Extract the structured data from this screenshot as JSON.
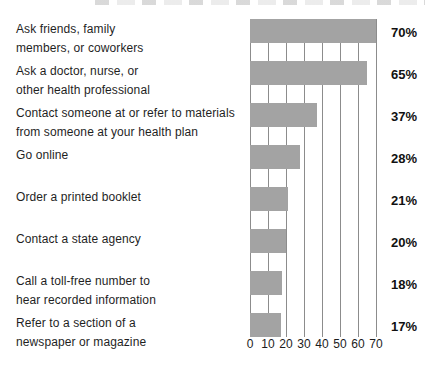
{
  "chart_data": {
    "type": "bar",
    "orientation": "horizontal",
    "title": "",
    "xlabel": "",
    "ylabel": "",
    "xlim": [
      0,
      70
    ],
    "x_ticks": [
      0,
      10,
      20,
      30,
      40,
      50,
      60,
      70
    ],
    "grid": "vertical",
    "legend": "none",
    "bar_color": "#a3a3a3",
    "gridline_color": "#8c8c8c",
    "text_color": "#1f1f1f",
    "unit": "percent",
    "categories": [
      "Ask friends, family members, or coworkers",
      "Ask a doctor, nurse, or other health professional",
      "Contact someone at or refer to materials from someone at your health plan",
      "Go online",
      "Order a printed booklet",
      "Contact a state agency",
      "Call a toll-free number to hear recorded information",
      "Refer to a section of a newspaper or magazine"
    ],
    "values": [
      70,
      65,
      37,
      28,
      21,
      20,
      18,
      17
    ],
    "rows": [
      {
        "label_lines": [
          "Ask friends, family",
          "members, or coworkers"
        ],
        "value": 70,
        "value_label": "70%"
      },
      {
        "label_lines": [
          "Ask a doctor, nurse, or",
          "other health professional"
        ],
        "value": 65,
        "value_label": "65%"
      },
      {
        "label_lines": [
          "Contact someone at or refer to materials",
          "from someone at your health plan"
        ],
        "value": 37,
        "value_label": "37%"
      },
      {
        "label_lines": [
          "Go online"
        ],
        "value": 28,
        "value_label": "28%"
      },
      {
        "label_lines": [
          "Order a printed booklet"
        ],
        "value": 21,
        "value_label": "21%"
      },
      {
        "label_lines": [
          "Contact a state agency"
        ],
        "value": 20,
        "value_label": "20%"
      },
      {
        "label_lines": [
          "Call a toll-free number to",
          "hear recorded information"
        ],
        "value": 18,
        "value_label": "18%"
      },
      {
        "label_lines": [
          "Refer to a section of a",
          "newspaper or magazine"
        ],
        "value": 17,
        "value_label": "17%"
      }
    ]
  }
}
